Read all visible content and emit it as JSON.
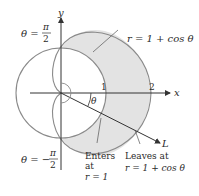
{
  "diagram": {
    "axes": {
      "x_label": "x",
      "y_label": "y"
    },
    "ticks": {
      "one": "1",
      "two": "2"
    },
    "labels": {
      "theta_top_lhs": "θ =",
      "theta_top_num": "π",
      "theta_top_den": "2",
      "theta_bottom_lhs": "θ = −",
      "theta_bottom_num": "π",
      "theta_bottom_den": "2",
      "curve_label": "r = 1 + cos θ",
      "angle_label": "θ",
      "line_label": "L",
      "enters_line1": "Enters",
      "enters_line2": "at",
      "enters_line3": "r = 1",
      "leaves_line1": "Leaves at",
      "leaves_line2": "r = 1 + cos θ"
    },
    "colors": {
      "shaded_region": "#e3e3e3",
      "curve_stroke": "#8a8a8a",
      "axis_stroke": "#333333",
      "text": "#2a2a2a"
    }
  }
}
